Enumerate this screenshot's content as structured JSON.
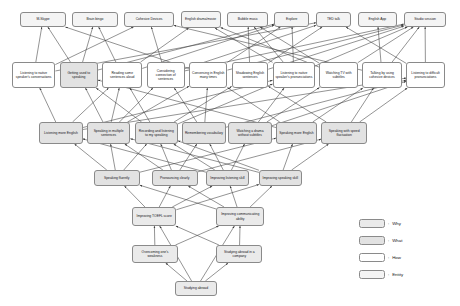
{
  "diagram": {
    "node_fill_colors": {
      "entity": "#f4f4f4",
      "how": "#ffffff",
      "what": "#e2e2e2",
      "why": "#eaeaea"
    },
    "edge_color": "#3a3a3a",
    "nodes": [
      {
        "id": "n0",
        "label": "M-Skype",
        "type": "entity",
        "x": 24,
        "y": 12,
        "w": 53,
        "h": 15
      },
      {
        "id": "n1",
        "label": "Brain bingo",
        "type": "entity",
        "x": 85,
        "y": 12,
        "w": 53,
        "h": 15
      },
      {
        "id": "n2",
        "label": "Cohesive Devices",
        "type": "entity",
        "x": 146,
        "y": 12,
        "w": 58,
        "h": 15
      },
      {
        "id": "n3",
        "label": "English drama/movie",
        "type": "entity",
        "x": 212,
        "y": 11,
        "w": 47,
        "h": 17
      },
      {
        "id": "n4",
        "label": "Bubble music",
        "type": "entity",
        "x": 267,
        "y": 12,
        "w": 48,
        "h": 15
      },
      {
        "id": "n5",
        "label": "Explore",
        "type": "entity",
        "x": 322,
        "y": 12,
        "w": 41,
        "h": 15
      },
      {
        "id": "n6",
        "label": "TED talk",
        "type": "entity",
        "x": 371,
        "y": 12,
        "w": 41,
        "h": 15
      },
      {
        "id": "n7",
        "label": "English App",
        "type": "entity",
        "x": 420,
        "y": 12,
        "w": 46,
        "h": 15
      },
      {
        "id": "n8",
        "label": "Studio session",
        "type": "entity",
        "x": 474,
        "y": 12,
        "w": 50,
        "h": 15
      },
      {
        "id": "m0",
        "label": "Listening to native speaker's conversations",
        "type": "how",
        "x": 14,
        "y": 62,
        "w": 51,
        "h": 26
      },
      {
        "id": "m1",
        "label": "Getting used to speaking",
        "type": "what",
        "x": 70,
        "y": 62,
        "w": 45,
        "h": 26
      },
      {
        "id": "m2",
        "label": "Reading some sentences aloud",
        "type": "how",
        "x": 120,
        "y": 62,
        "w": 47,
        "h": 26
      },
      {
        "id": "m3",
        "label": "Considering connection of sentences",
        "type": "how",
        "x": 172,
        "y": 62,
        "w": 45,
        "h": 26
      },
      {
        "id": "m4",
        "label": "Conversing in English many times",
        "type": "how",
        "x": 222,
        "y": 62,
        "w": 45,
        "h": 26
      },
      {
        "id": "m5",
        "label": "Shadowing English sentences",
        "type": "how",
        "x": 272,
        "y": 62,
        "w": 43,
        "h": 26
      },
      {
        "id": "m6",
        "label": "Listening to native speaker's pronunciations",
        "type": "how",
        "x": 320,
        "y": 62,
        "w": 50,
        "h": 26
      },
      {
        "id": "m7",
        "label": "Watching TV with subtitles",
        "type": "how",
        "x": 375,
        "y": 62,
        "w": 45,
        "h": 26
      },
      {
        "id": "m8",
        "label": "Talking by using cohesive devices",
        "type": "how",
        "x": 425,
        "y": 62,
        "w": 47,
        "h": 26
      },
      {
        "id": "m9",
        "label": "Listening to difficult pronunciations",
        "type": "how",
        "x": 477,
        "y": 62,
        "w": 45,
        "h": 26
      },
      {
        "id": "k0",
        "label": "Listening more English",
        "type": "what",
        "x": 46,
        "y": 122,
        "w": 51,
        "h": 22
      },
      {
        "id": "k1",
        "label": "Speaking in multiple sentences",
        "type": "what",
        "x": 102,
        "y": 122,
        "w": 51,
        "h": 22
      },
      {
        "id": "k2",
        "label": "Recording and listening to my speaking",
        "type": "what",
        "x": 158,
        "y": 122,
        "w": 51,
        "h": 22
      },
      {
        "id": "k3",
        "label": "Remembering vocabulary",
        "type": "what",
        "x": 214,
        "y": 122,
        "w": 51,
        "h": 22
      },
      {
        "id": "k4",
        "label": "Watching a drama without subtitles",
        "type": "what",
        "x": 268,
        "y": 122,
        "w": 51,
        "h": 22
      },
      {
        "id": "k5",
        "label": "Speaking more English",
        "type": "what",
        "x": 324,
        "y": 122,
        "w": 48,
        "h": 22
      },
      {
        "id": "k6",
        "label": "Speaking with speed fluctuation",
        "type": "what",
        "x": 377,
        "y": 122,
        "w": 54,
        "h": 22
      },
      {
        "id": "j0",
        "label": "Speaking fluently",
        "type": "what",
        "x": 110,
        "y": 170,
        "w": 54,
        "h": 16
      },
      {
        "id": "j1",
        "label": "Pronouncing clearly",
        "type": "what",
        "x": 178,
        "y": 170,
        "w": 54,
        "h": 16
      },
      {
        "id": "j2",
        "label": "Improving listening skill",
        "type": "what",
        "x": 242,
        "y": 170,
        "w": 50,
        "h": 16
      },
      {
        "id": "j3",
        "label": "Improving speaking skill",
        "type": "what",
        "x": 304,
        "y": 170,
        "w": 50,
        "h": 16
      },
      {
        "id": "i0",
        "label": "Improving TOEFL score",
        "type": "why",
        "x": 155,
        "y": 207,
        "w": 52,
        "h": 19
      },
      {
        "id": "i1",
        "label": "Improving communicating ability",
        "type": "why",
        "x": 254,
        "y": 207,
        "w": 56,
        "h": 19
      },
      {
        "id": "h0",
        "label": "Overcoming one's weakness",
        "type": "why",
        "x": 155,
        "y": 245,
        "w": 54,
        "h": 18
      },
      {
        "id": "h1",
        "label": "Studying abroad in a company",
        "type": "why",
        "x": 254,
        "y": 245,
        "w": 54,
        "h": 18
      },
      {
        "id": "g0",
        "label": "Studying abroad",
        "type": "why",
        "x": 205,
        "y": 281,
        "w": 50,
        "h": 15
      }
    ],
    "edges": [
      [
        "m0",
        "n0"
      ],
      [
        "m0",
        "n2"
      ],
      [
        "m1",
        "n0"
      ],
      [
        "m1",
        "n1"
      ],
      [
        "m2",
        "n1"
      ],
      [
        "m2",
        "n3"
      ],
      [
        "m3",
        "n2"
      ],
      [
        "m3",
        "n6"
      ],
      [
        "m4",
        "n0"
      ],
      [
        "m4",
        "n5"
      ],
      [
        "m5",
        "n4"
      ],
      [
        "m5",
        "n6"
      ],
      [
        "m6",
        "n3"
      ],
      [
        "m6",
        "n5"
      ],
      [
        "m6",
        "n8"
      ],
      [
        "m7",
        "n3"
      ],
      [
        "m7",
        "n4"
      ],
      [
        "m8",
        "n2"
      ],
      [
        "m8",
        "n7"
      ],
      [
        "m9",
        "n6"
      ],
      [
        "m9",
        "n8"
      ],
      [
        "m2",
        "n5"
      ],
      [
        "m4",
        "n8"
      ],
      [
        "m5",
        "n8"
      ],
      [
        "m1",
        "n5"
      ],
      [
        "m0",
        "n6"
      ],
      [
        "m3",
        "n8"
      ],
      [
        "m7",
        "n8"
      ],
      [
        "m6",
        "n4"
      ],
      [
        "m8",
        "n8"
      ],
      [
        "k0",
        "m0"
      ],
      [
        "k0",
        "m2"
      ],
      [
        "k0",
        "m6"
      ],
      [
        "k1",
        "m1"
      ],
      [
        "k1",
        "m4"
      ],
      [
        "k1",
        "m3"
      ],
      [
        "k2",
        "m2"
      ],
      [
        "k2",
        "m5"
      ],
      [
        "k2",
        "m1"
      ],
      [
        "k3",
        "m3"
      ],
      [
        "k3",
        "m4"
      ],
      [
        "k4",
        "m7"
      ],
      [
        "k4",
        "m6"
      ],
      [
        "k5",
        "m4"
      ],
      [
        "k5",
        "m8"
      ],
      [
        "k6",
        "m9"
      ],
      [
        "k6",
        "m5"
      ],
      [
        "k6",
        "m8"
      ],
      [
        "k2",
        "m6"
      ],
      [
        "k3",
        "m9"
      ],
      [
        "k5",
        "m1"
      ],
      [
        "k0",
        "m9"
      ],
      [
        "k4",
        "m9"
      ],
      [
        "k1",
        "m2"
      ],
      [
        "j0",
        "k1"
      ],
      [
        "j0",
        "k2"
      ],
      [
        "j0",
        "k5"
      ],
      [
        "j0",
        "k0"
      ],
      [
        "j1",
        "k2"
      ],
      [
        "j1",
        "k6"
      ],
      [
        "j1",
        "k1"
      ],
      [
        "j1",
        "k3"
      ],
      [
        "j2",
        "k0"
      ],
      [
        "j2",
        "k4"
      ],
      [
        "j2",
        "k3"
      ],
      [
        "j3",
        "k5"
      ],
      [
        "j3",
        "k6"
      ],
      [
        "j3",
        "k1"
      ],
      [
        "j3",
        "k2"
      ],
      [
        "j2",
        "k2"
      ],
      [
        "i0",
        "j0"
      ],
      [
        "i0",
        "j1"
      ],
      [
        "i0",
        "j2"
      ],
      [
        "i0",
        "j3"
      ],
      [
        "i1",
        "j0"
      ],
      [
        "i1",
        "j1"
      ],
      [
        "i1",
        "j2"
      ],
      [
        "i1",
        "j3"
      ],
      [
        "h0",
        "i0"
      ],
      [
        "h0",
        "i1"
      ],
      [
        "h1",
        "i0"
      ],
      [
        "h1",
        "i1"
      ],
      [
        "g0",
        "h0"
      ],
      [
        "g0",
        "h1"
      ],
      [
        "g0",
        "i0"
      ],
      [
        "g0",
        "i1"
      ]
    ]
  },
  "legend": {
    "items": [
      {
        "label": "Why",
        "type": "why"
      },
      {
        "label": "What",
        "type": "what"
      },
      {
        "label": "How",
        "type": "how"
      },
      {
        "label": "Entity",
        "type": "entity"
      }
    ],
    "separator": ":"
  }
}
